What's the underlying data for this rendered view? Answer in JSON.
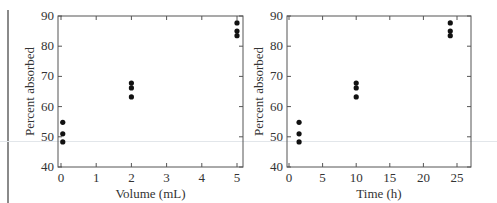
{
  "chart_data": [
    {
      "type": "scatter",
      "title": "",
      "xlabel": "Volume (mL)",
      "ylabel": "Percent absorbed",
      "xlim": [
        -0.1,
        5.15
      ],
      "ylim": [
        40,
        90
      ],
      "x_ticks": [
        0,
        1,
        2,
        3,
        4,
        5
      ],
      "y_ticks": [
        40,
        50,
        60,
        70,
        80,
        90
      ],
      "grid": false,
      "legend": null,
      "series": [
        {
          "name": "observations",
          "points": [
            {
              "x": 0.05,
              "y": 54.8
            },
            {
              "x": 0.05,
              "y": 51.0
            },
            {
              "x": 0.05,
              "y": 48.3
            },
            {
              "x": 2,
              "y": 67.8
            },
            {
              "x": 2,
              "y": 66.2
            },
            {
              "x": 2,
              "y": 63.2
            },
            {
              "x": 5,
              "y": 87.7
            },
            {
              "x": 5,
              "y": 85.0
            },
            {
              "x": 5,
              "y": 83.5
            }
          ]
        }
      ]
    },
    {
      "type": "scatter",
      "title": "",
      "xlabel": "Time (h)",
      "ylabel": "Percent absorbed",
      "xlim": [
        -0.3,
        27
      ],
      "ylim": [
        40,
        90
      ],
      "x_ticks": [
        0,
        5,
        10,
        15,
        20,
        25
      ],
      "y_ticks": [
        40,
        50,
        60,
        70,
        80,
        90
      ],
      "grid": false,
      "legend": null,
      "series": [
        {
          "name": "observations",
          "points": [
            {
              "x": 1.5,
              "y": 54.8
            },
            {
              "x": 1.5,
              "y": 51.0
            },
            {
              "x": 1.5,
              "y": 48.3
            },
            {
              "x": 10,
              "y": 67.8
            },
            {
              "x": 10,
              "y": 66.2
            },
            {
              "x": 10,
              "y": 63.2
            },
            {
              "x": 24,
              "y": 87.7
            },
            {
              "x": 24,
              "y": 85.0
            },
            {
              "x": 24,
              "y": 83.5
            }
          ]
        }
      ]
    }
  ],
  "plots": [
    {
      "id": "volume",
      "frame": {
        "left": 58,
        "top": 16,
        "right": 243,
        "bottom": 167
      },
      "x0px": 61,
      "xunit": 35.2
    },
    {
      "id": "time",
      "frame": {
        "left": 287,
        "top": 16,
        "right": 471,
        "bottom": 167
      },
      "x0px": 289,
      "xunit": 6.72
    }
  ],
  "style": {
    "point_color": "#111111",
    "axis_color": "#555555"
  }
}
